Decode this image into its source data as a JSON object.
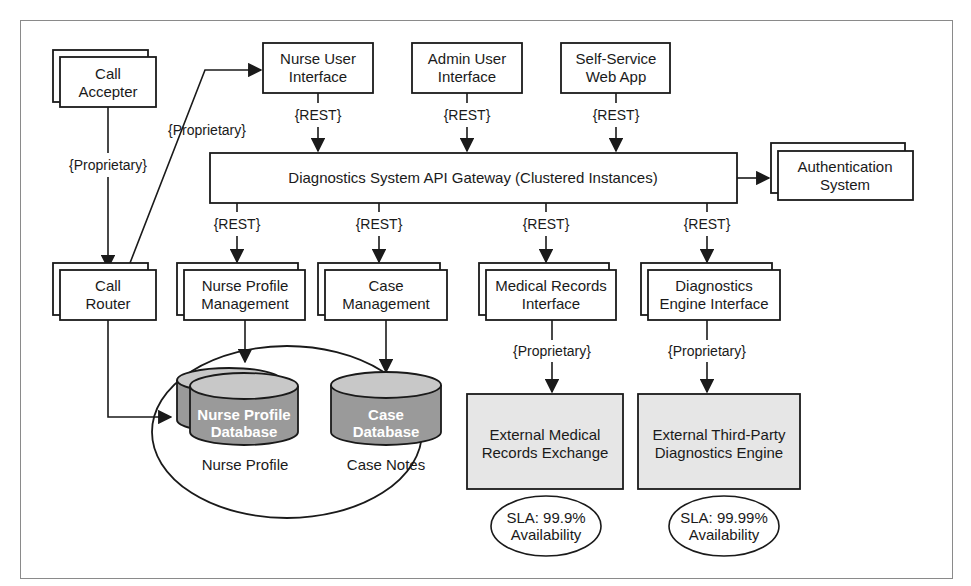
{
  "diagram": {
    "colors": {
      "stroke": "#1a1a1a",
      "box_fill": "#ffffff",
      "external_fill": "#e6e6e6",
      "database_fill": "#9a9a9a",
      "database_top": "#c8c8c8",
      "database_text": "#ffffff",
      "frame": "#8a8a8a"
    },
    "nodes": {
      "call_accepter": {
        "line1": "Call",
        "line2": "Accepter",
        "stacked": true
      },
      "nurse_ui": {
        "line1": "Nurse User",
        "line2": "Interface"
      },
      "admin_ui": {
        "line1": "Admin User",
        "line2": "Interface"
      },
      "self_service": {
        "line1": "Self-Service",
        "line2": "Web App"
      },
      "gateway": {
        "label": "Diagnostics System API Gateway (Clustered Instances)"
      },
      "auth": {
        "line1": "Authentication",
        "line2": "System",
        "stacked": true
      },
      "call_router": {
        "line1": "Call",
        "line2": "Router",
        "stacked": true
      },
      "nurse_profile_mgmt": {
        "line1": "Nurse Profile",
        "line2": "Management",
        "stacked": true
      },
      "case_mgmt": {
        "line1": "Case",
        "line2": "Management",
        "stacked": true
      },
      "medical_records_if": {
        "line1": "Medical Records",
        "line2": "Interface",
        "stacked": true
      },
      "diag_engine_if": {
        "line1": "Diagnostics",
        "line2": "Engine Interface",
        "stacked": true
      },
      "nurse_profile_db": {
        "line1": "Nurse Profile",
        "line2": "Database",
        "caption": "Nurse Profile",
        "stacked": true
      },
      "case_db": {
        "line1": "Case",
        "line2": "Database",
        "caption": "Case Notes"
      },
      "ext_medical": {
        "line1": "External Medical",
        "line2": "Records Exchange"
      },
      "ext_diag": {
        "line1": "External Third-Party",
        "line2": "Diagnostics Engine"
      }
    },
    "slas": {
      "ext_medical": {
        "line1": "SLA: 99.9%",
        "line2": "Availability"
      },
      "ext_diag": {
        "line1": "SLA: 99.99%",
        "line2": "Availability"
      }
    },
    "edges": {
      "accepter_to_router": "{Proprietary}",
      "router_to_nurse_ui": "{Proprietary}",
      "nurse_ui_to_gateway": "{REST}",
      "admin_ui_to_gateway": "{REST}",
      "self_service_to_gateway": "{REST}",
      "gateway_to_npm": "{REST}",
      "gateway_to_case": "{REST}",
      "gateway_to_mri": "{REST}",
      "gateway_to_dei": "{REST}",
      "mri_to_ext_medical": "{Proprietary}",
      "dei_to_ext_diag": "{Proprietary}"
    }
  }
}
